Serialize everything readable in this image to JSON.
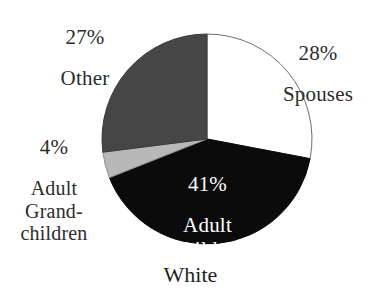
{
  "chart_data": {
    "type": "pie",
    "title": "White",
    "xlabel": "",
    "ylabel": "",
    "legend_position": "none",
    "grid": false,
    "total": 100,
    "units": "%",
    "categories": [
      "Spouses",
      "Adult Children",
      "Adult Grandchildren",
      "Other"
    ],
    "values": [
      28,
      41,
      4,
      27
    ],
    "slices": [
      {
        "label": "Spouses",
        "label_lines": "28%\nSpouses",
        "percent_text": "28%",
        "category_text": "Spouses",
        "value": 28,
        "color": "#ffffff",
        "stroke": "#6f6f6f",
        "start_angle_deg": 0,
        "end_angle_deg": 100.8,
        "label_placement": "outside-right"
      },
      {
        "label": "Adult Children",
        "label_lines": "41%\nAdult\nChildren",
        "percent_text": "41%",
        "category_text": "Adult\nChildren",
        "value": 41,
        "color": "#0b0b0b",
        "stroke": "#0b0b0b",
        "start_angle_deg": 100.8,
        "end_angle_deg": 248.4,
        "label_placement": "inside",
        "label_color": "#ffffff"
      },
      {
        "label": "Adult Grandchildren",
        "label_lines": "4%\nAdult\nGrand-\nchildren",
        "percent_text": "4%",
        "category_text": "Adult\nGrand-\nchildren",
        "value": 4,
        "color": "#b8b8b8",
        "stroke": "#8d8d8d",
        "start_angle_deg": 248.4,
        "end_angle_deg": 262.8,
        "label_placement": "outside-left"
      },
      {
        "label": "Other",
        "label_lines": "27%\nOther",
        "percent_text": "27%",
        "category_text": "Other",
        "value": 27,
        "color": "#464646",
        "stroke": "#3a3a3a",
        "start_angle_deg": 262.8,
        "end_angle_deg": 360,
        "label_placement": "outside-top-left"
      }
    ],
    "caption": "White",
    "geometry": {
      "center_x": 207,
      "center_y": 139,
      "radius": 105
    }
  },
  "labels": {
    "other": {
      "percent": "27%",
      "category": "Other"
    },
    "spouses": {
      "percent": "28%",
      "category": "Spouses"
    },
    "grandchildren": {
      "percent": "4%",
      "category": "Adult\nGrand-\nchildren"
    },
    "children": {
      "percent": "41%",
      "category": "Adult\nChildren"
    }
  },
  "caption": "White"
}
